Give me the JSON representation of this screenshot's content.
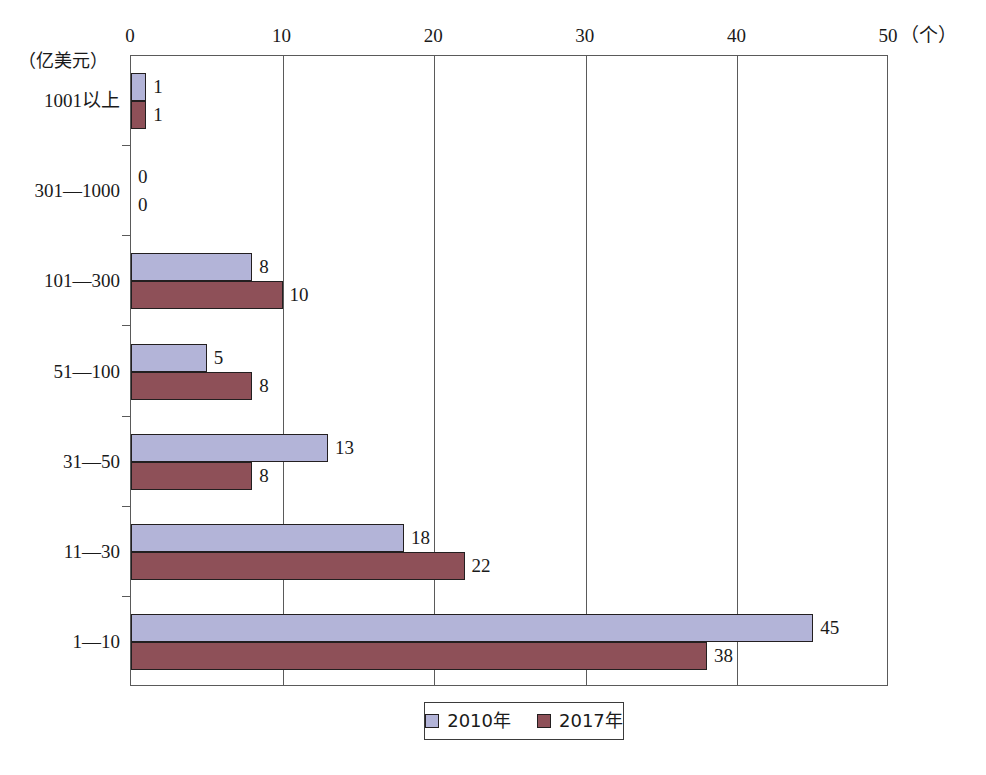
{
  "chart_data": {
    "type": "bar",
    "orientation": "horizontal",
    "title": "",
    "xlabel": "（个）",
    "ylabel": "（亿美元）",
    "xlim": [
      0,
      50
    ],
    "xticks": [
      0,
      10,
      20,
      30,
      40,
      50
    ],
    "xtick_labels": [
      "0",
      "10",
      "20",
      "30",
      "40",
      "50"
    ],
    "grid": true,
    "grid_axis": "x",
    "legend_position": "bottom-center",
    "categories": [
      "1001以上",
      "301—1000",
      "101—300",
      "51—100",
      "31—50",
      "11—30",
      "1—10"
    ],
    "series": [
      {
        "name": "2010年",
        "color": "#b3b4d8",
        "values": [
          1,
          0,
          8,
          5,
          13,
          18,
          45
        ],
        "value_labels": [
          "1",
          "0",
          "8",
          "5",
          "13",
          "18",
          "45"
        ]
      },
      {
        "name": "2017年",
        "color": "#8e5058",
        "values": [
          1,
          0,
          10,
          8,
          8,
          22,
          38
        ],
        "value_labels": [
          "1",
          "0",
          "10",
          "8",
          "8",
          "22",
          "38"
        ]
      }
    ]
  },
  "axes": {
    "x_unit": "（个）",
    "y_unit": "（亿美元）"
  },
  "legend": {
    "items": [
      {
        "label": "2010年",
        "color": "#b3b4d8"
      },
      {
        "label": "2017年",
        "color": "#8e5058"
      }
    ]
  },
  "colors": {
    "series_2010": "#b3b4d8",
    "series_2017": "#8e5058",
    "axis": "#5a5a5a",
    "bar_outline": "#231f20",
    "background": "#ffffff"
  }
}
